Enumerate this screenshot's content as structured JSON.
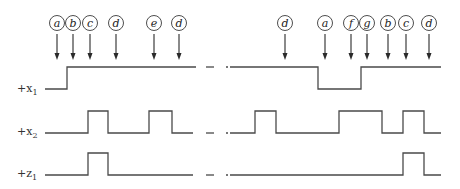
{
  "diagram": {
    "type": "timing-diagram",
    "events": [
      {
        "label": "a",
        "x": 57
      },
      {
        "label": "b",
        "x": 73
      },
      {
        "label": "c",
        "x": 90
      },
      {
        "label": "d",
        "x": 116
      },
      {
        "label": "e",
        "x": 154
      },
      {
        "label": "d",
        "x": 179
      },
      {
        "label": "d",
        "x": 285
      },
      {
        "label": "a",
        "x": 325
      },
      {
        "label": "f",
        "x": 351
      },
      {
        "label": "g",
        "x": 367
      },
      {
        "label": "b",
        "x": 388
      },
      {
        "label": "c",
        "x": 406
      },
      {
        "label": "d",
        "x": 429
      }
    ],
    "signals": [
      {
        "name": "+x",
        "subscript": "1",
        "label_y": 92
      },
      {
        "name": "+x",
        "subscript": "2",
        "label_y": 135
      },
      {
        "name": "+z",
        "subscript": "1",
        "label_y": 177
      }
    ],
    "break_marker": "— —"
  }
}
